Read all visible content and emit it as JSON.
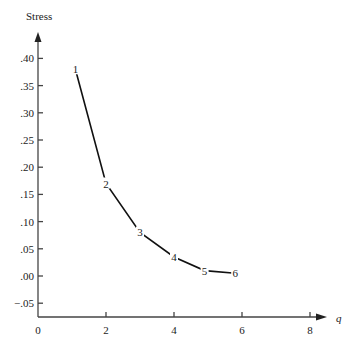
{
  "chart_data": {
    "type": "line",
    "title": "",
    "xlabel": "q",
    "ylabel": "Stress",
    "xlim": [
      0,
      8.5
    ],
    "ylim": [
      -0.06,
      0.45
    ],
    "grid": false,
    "legend": "none",
    "x_ticks": [
      "0",
      "2",
      "4",
      "6",
      "8"
    ],
    "y_ticks": [
      ".40",
      ".35",
      ".30",
      ".25",
      ".20",
      ".15",
      ".10",
      ".05",
      ".00",
      "−.05"
    ],
    "series": [
      {
        "name": "Stress",
        "x": [
          1.1,
          2.0,
          3.0,
          4.0,
          4.9,
          5.8
        ],
        "values": [
          0.38,
          0.17,
          0.08,
          0.035,
          0.01,
          0.005
        ],
        "point_labels": [
          "1",
          "2",
          "3",
          "4",
          "5",
          "6"
        ]
      }
    ]
  }
}
